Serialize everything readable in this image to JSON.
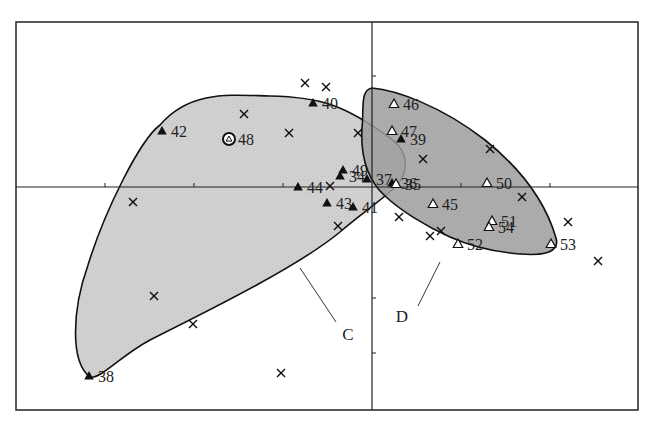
{
  "chart_data": {
    "type": "scatter",
    "title": "",
    "xlabel": "",
    "ylabel": "",
    "grid": false,
    "legend": null,
    "frame": {
      "left": 16,
      "top": 22,
      "right": 638,
      "bottom": 410
    },
    "origin_px": {
      "x": 372,
      "y": 187
    },
    "x_ticks_px": [
      105,
      194,
      283,
      461,
      550
    ],
    "y_ticks_px": [
      76,
      298,
      353
    ],
    "groups": [
      {
        "name": "C",
        "fill": "#c9c9c9",
        "label_pos": [
          348,
          340
        ],
        "leader": [
          [
            300,
            268
          ],
          [
            336,
            322
          ]
        ],
        "outline": "M90,377 C70,362 72,310 88,265 C105,210 140,140 160,125 C190,90 230,95 270,96 C320,97 345,105 390,138 C410,152 410,175 392,190 C375,205 360,215 340,232 C300,265 220,305 150,340 C120,356 100,380 90,377 Z"
      },
      {
        "name": "D",
        "fill": "#9f9f9f",
        "label_pos": [
          402,
          322
        ],
        "leader": [
          [
            418,
            306
          ],
          [
            440,
            262
          ]
        ],
        "outline": "M372,88 C395,90 440,105 485,140 C520,168 545,200 556,238 C560,252 545,256 520,254 C495,252 470,246 450,237 C425,226 400,210 385,196 C370,182 360,162 362,128 C364,108 360,90 372,88 Z"
      }
    ],
    "points_filled_triangle": [
      {
        "id": "38",
        "x": 89,
        "y": 376
      },
      {
        "id": "40",
        "x": 313,
        "y": 103
      },
      {
        "id": "42",
        "x": 162,
        "y": 131
      },
      {
        "id": "44",
        "x": 298,
        "y": 187
      },
      {
        "id": "34",
        "x": 340,
        "y": 176
      },
      {
        "id": "49",
        "x": 343,
        "y": 170
      },
      {
        "id": "37",
        "x": 367,
        "y": 179
      },
      {
        "id": "36",
        "x": 392,
        "y": 183
      },
      {
        "id": "39",
        "x": 401,
        "y": 139
      },
      {
        "id": "43",
        "x": 327,
        "y": 203
      },
      {
        "id": "41",
        "x": 353,
        "y": 207
      }
    ],
    "points_open_triangle": [
      {
        "id": "46",
        "x": 394,
        "y": 104
      },
      {
        "id": "47",
        "x": 392,
        "y": 131
      },
      {
        "id": "35",
        "x": 396,
        "y": 184
      },
      {
        "id": "50",
        "x": 487,
        "y": 183
      },
      {
        "id": "45",
        "x": 433,
        "y": 204
      },
      {
        "id": "51",
        "x": 492,
        "y": 221
      },
      {
        "id": "54",
        "x": 489,
        "y": 227
      },
      {
        "id": "52",
        "x": 458,
        "y": 244
      },
      {
        "id": "53",
        "x": 551,
        "y": 244
      }
    ],
    "points_circled": [
      {
        "id": "48",
        "x": 229,
        "y": 139
      }
    ],
    "points_cross": [
      {
        "x": 305,
        "y": 83
      },
      {
        "x": 326,
        "y": 87
      },
      {
        "x": 244,
        "y": 114
      },
      {
        "x": 289,
        "y": 133
      },
      {
        "x": 358,
        "y": 133
      },
      {
        "x": 423,
        "y": 159
      },
      {
        "x": 490,
        "y": 149
      },
      {
        "x": 133,
        "y": 202
      },
      {
        "x": 330,
        "y": 186
      },
      {
        "x": 338,
        "y": 226
      },
      {
        "x": 399,
        "y": 217
      },
      {
        "x": 430,
        "y": 236
      },
      {
        "x": 441,
        "y": 231
      },
      {
        "x": 522,
        "y": 197
      },
      {
        "x": 568,
        "y": 222
      },
      {
        "x": 598,
        "y": 261
      },
      {
        "x": 154,
        "y": 296
      },
      {
        "x": 193,
        "y": 324
      },
      {
        "x": 281,
        "y": 373
      }
    ]
  }
}
